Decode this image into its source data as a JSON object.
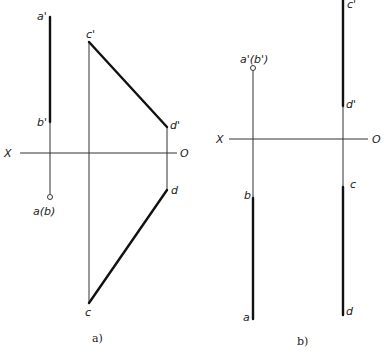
{
  "figure_a": {
    "caption": "a)",
    "axis": {
      "left_label": "X",
      "right_label": "O"
    },
    "labels": {
      "a_prime": "a'",
      "b_prime": "b'",
      "ab_top": "a(b)",
      "c_prime": "c'",
      "d_prime": "d'",
      "d": "d",
      "c": "c"
    }
  },
  "figure_b": {
    "caption": "b)",
    "axis": {
      "left_label": "X",
      "right_label": "O"
    },
    "labels": {
      "ab_prime": "a'(b')",
      "c_prime": "c'",
      "d_prime": "d'",
      "b": "b",
      "a": "a",
      "c": "c",
      "d": "d"
    }
  }
}
